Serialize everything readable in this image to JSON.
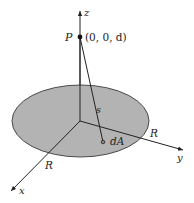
{
  "diagram": {
    "axes": {
      "z_label": "z",
      "y_label": "y",
      "x_label": "x"
    },
    "point_P": {
      "label": "P",
      "coordinates": "(0, 0, d)"
    },
    "distance_label": "s",
    "area_element_label": "dA",
    "radius_labels": [
      "R",
      "R"
    ],
    "colors": {
      "disk_fill": "#b3b3b3",
      "disk_stroke": "#4a4a4a",
      "line": "#222222",
      "background": "#ffffff"
    }
  }
}
